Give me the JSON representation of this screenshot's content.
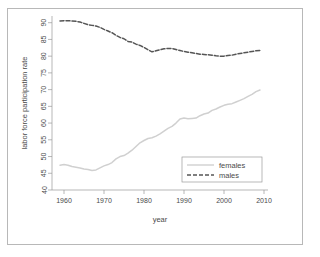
{
  "figure": {
    "border_color": "#b8b8b8",
    "background": "#ffffff"
  },
  "chart_data": {
    "type": "line",
    "title": "",
    "xlabel": "year",
    "ylabel": "labor force participation rate",
    "xlim": [
      1957,
      2011
    ],
    "ylim": [
      40,
      92
    ],
    "xticks": [
      1960,
      1970,
      1980,
      1990,
      2000,
      2010
    ],
    "yticks": [
      40,
      45,
      50,
      55,
      60,
      65,
      70,
      75,
      80,
      85,
      90
    ],
    "grid": false,
    "legend_position": "lower right",
    "legend_entries": [
      "females",
      "males"
    ],
    "x": [
      1959,
      1960,
      1961,
      1962,
      1963,
      1964,
      1965,
      1966,
      1967,
      1968,
      1969,
      1970,
      1971,
      1972,
      1973,
      1974,
      1975,
      1976,
      1977,
      1978,
      1979,
      1980,
      1981,
      1982,
      1983,
      1984,
      1985,
      1986,
      1987,
      1988,
      1989,
      1990,
      1991,
      1992,
      1993,
      1994,
      1995,
      1996,
      1997,
      1998,
      1999,
      2000,
      2001,
      2002,
      2003,
      2004,
      2005,
      2006,
      2007,
      2008,
      2009
    ],
    "series": [
      {
        "name": "females",
        "color": "#d0d0d0",
        "style": "solid",
        "values": [
          47.4,
          47.6,
          47.4,
          47.0,
          46.8,
          46.6,
          46.3,
          46.1,
          45.8,
          46.0,
          46.6,
          47.2,
          47.6,
          48.2,
          49.3,
          50.0,
          50.3,
          51.0,
          51.9,
          53.0,
          54.1,
          54.8,
          55.4,
          55.6,
          56.1,
          56.8,
          57.6,
          58.4,
          59.0,
          60.0,
          61.2,
          61.5,
          61.3,
          61.4,
          61.5,
          62.2,
          62.7,
          63.0,
          63.8,
          64.2,
          64.8,
          65.3,
          65.6,
          65.8,
          66.3,
          66.8,
          67.3,
          68.0,
          68.6,
          69.4,
          69.9
        ]
      },
      {
        "name": "males",
        "color": "#555555",
        "style": "dashed",
        "values": [
          90.5,
          90.6,
          90.6,
          90.5,
          90.4,
          90.2,
          89.8,
          89.4,
          89.2,
          89.0,
          88.6,
          88.0,
          87.5,
          87.0,
          86.2,
          85.6,
          85.2,
          84.4,
          84.2,
          83.6,
          83.2,
          82.6,
          81.9,
          81.3,
          81.6,
          81.9,
          82.2,
          82.3,
          82.3,
          82.0,
          81.7,
          81.4,
          81.2,
          81.0,
          80.8,
          80.6,
          80.5,
          80.4,
          80.3,
          80.1,
          80.0,
          80.0,
          80.2,
          80.3,
          80.6,
          80.8,
          81.0,
          81.2,
          81.4,
          81.6,
          81.7
        ]
      }
    ]
  }
}
